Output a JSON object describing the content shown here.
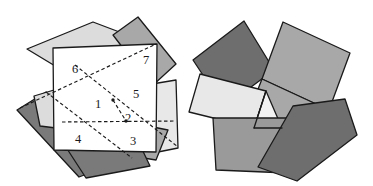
{
  "figure": {
    "width": 373,
    "height": 186,
    "background": "#ffffff",
    "stroke_color": "#1a1a1a",
    "stroke_width": 1.3,
    "dash_pattern": "3.5,2.5",
    "palette": {
      "white": "#ffffff",
      "very_light_gray": "#e8e8e8",
      "light_gray": "#dcdcdc",
      "mid_light_gray": "#c4c4c4",
      "mid_gray": "#a8a8a8",
      "gray": "#9a9a9a",
      "dark_gray": "#7a7a7a",
      "darker_gray": "#6e6e6e"
    },
    "left_panel": {
      "name": "assembled-square-figure",
      "description": "Seven overlapping quadrilateral tiles with a white square outline on top and dashed interior cut lines",
      "background_tiles": [
        {
          "name": "tile-upper-left-light",
          "fill": "#dcdcdc",
          "points": "27,49 93,22 159,47 133,113"
        },
        {
          "name": "tile-upper-right-gray",
          "fill": "#a8a8a8",
          "points": "113,35 138,17 176,64 152,86"
        },
        {
          "name": "tile-right-light",
          "fill": "#e8e8e8",
          "points": "140,86 176,80 178,148 143,155"
        },
        {
          "name": "tile-lower-right-gray",
          "fill": "#a8a8a8",
          "points": "118,120 168,130 156,160 106,152"
        },
        {
          "name": "tile-lower-left-dark",
          "fill": "#7a7a7a",
          "points": "17,110 46,92 129,158 79,177"
        },
        {
          "name": "tile-bottom-dark",
          "fill": "#7a7a7a",
          "points": "60,138 140,145 150,166 86,178"
        },
        {
          "name": "tile-left-light-wedge",
          "fill": "#dcdcdc",
          "points": "34,96 54,90 56,128 40,126"
        }
      ],
      "white_square": {
        "name": "white-square-outline",
        "fill": "#ffffff",
        "points": "53,48 157,44 156,152 54,150"
      },
      "dashed_cuts": [
        {
          "name": "cut-line-long-diagonal-a",
          "points": "20,108 156,44"
        },
        {
          "name": "cut-line-long-diagonal-b",
          "points": "46,92 132,158"
        },
        {
          "name": "cut-line-long-diagonal-c",
          "points": "75,65 178,147"
        },
        {
          "name": "cut-line-horizontal",
          "points": "62,122 176,121"
        },
        {
          "name": "cut-line-short-spur",
          "points": "113,100 126,121"
        }
      ],
      "vertex_dots": [
        {
          "name": "vertex-dot-upper",
          "cx": 113,
          "cy": 100
        },
        {
          "name": "vertex-dot-center",
          "cx": 126,
          "cy": 121
        }
      ],
      "labels": [
        {
          "name": "piece-label-1",
          "text": "1",
          "x": 98,
          "y": 105
        },
        {
          "name": "piece-label-2",
          "text": "2",
          "x": 128,
          "y": 119
        },
        {
          "name": "piece-label-3",
          "text": "3",
          "x": 133,
          "y": 142
        },
        {
          "name": "piece-label-4",
          "text": "4",
          "x": 78,
          "y": 140
        },
        {
          "name": "piece-label-5",
          "text": "5",
          "x": 136,
          "y": 95
        },
        {
          "name": "piece-label-6",
          "text": "6",
          "x": 75,
          "y": 70
        },
        {
          "name": "piece-label-7",
          "text": "7",
          "x": 146,
          "y": 61
        }
      ]
    },
    "right_panel": {
      "name": "rearranged-pieces-figure",
      "description": "The same seven pieces rotated and rearranged into a pinwheel cluster",
      "tiles": [
        {
          "name": "tile-upper-left-dark",
          "fill": "#6e6e6e",
          "points": "193,60 244,21 274,70 224,107"
        },
        {
          "name": "tile-upper-right-mid",
          "fill": "#a8a8a8",
          "points": "283,22 350,53 329,110 262,79"
        },
        {
          "name": "tile-center-right-mid",
          "fill": "#a8a8a8",
          "points": "262,79 329,110 315,141 249,112"
        },
        {
          "name": "tile-left-lightest",
          "fill": "#e8e8e8",
          "points": "200,74 266,91 254,128 189,112"
        },
        {
          "name": "tile-center-white-triangle",
          "fill": "#f2f2f2",
          "points": "254,128 266,91 282,128"
        },
        {
          "name": "tile-bottom-left-mid",
          "fill": "#9a9a9a",
          "points": "213,118 302,118 288,173 216,170"
        },
        {
          "name": "tile-bottom-right-dark",
          "fill": "#6e6e6e",
          "points": "293,106 345,99 357,135 297,181 258,167"
        }
      ],
      "accent_lines": [
        {
          "name": "accent-line-triangle-edge",
          "points": "254,128 266,91"
        },
        {
          "name": "accent-line-triangle-base",
          "points": "254,128 282,128"
        }
      ]
    }
  }
}
